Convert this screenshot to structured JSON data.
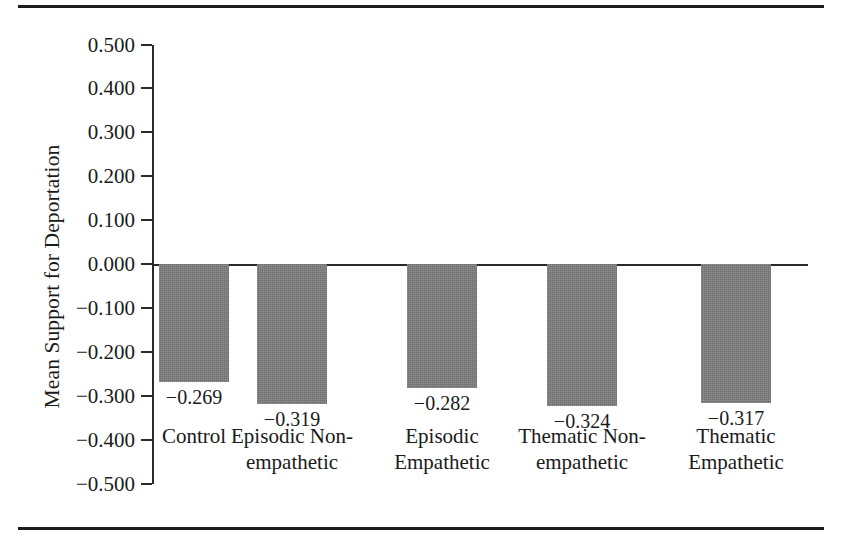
{
  "chart_data": {
    "type": "bar",
    "title": "",
    "xlabel": "",
    "ylabel": "Mean Support for Deportation",
    "categories": [
      "Control",
      "Episodic Non-\nempathetic",
      "Episodic\nEmpathetic",
      "Thematic Non-\nempathetic",
      "Thematic\nEmpathetic"
    ],
    "values": [
      -0.269,
      -0.319,
      -0.282,
      -0.324,
      -0.317
    ],
    "value_labels": [
      "−0.269",
      "−0.319",
      "−0.282",
      "−0.324",
      "−0.317"
    ],
    "ylim": [
      -0.5,
      0.5
    ],
    "ytick_values": [
      0.5,
      0.4,
      0.3,
      0.2,
      0.1,
      0.0,
      -0.1,
      -0.2,
      -0.3,
      -0.4,
      -0.5
    ],
    "ytick_labels": [
      "0.500",
      "0.400",
      "0.300",
      "0.200",
      "0.100",
      "0.000",
      "−0.100",
      "−0.200",
      "−0.300",
      "−0.400",
      "−0.500"
    ],
    "grid": false,
    "legend": null,
    "bar_color": "#6f6f6f",
    "axis_color": "#2a2a2a"
  }
}
